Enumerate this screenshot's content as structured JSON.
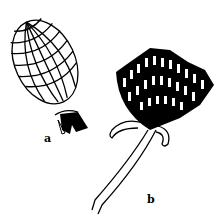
{
  "figure": {
    "type": "botanical-line-drawing",
    "panels": [
      {
        "id": "a",
        "label": "a",
        "subject": "closed flower bud covered with overlapping scales"
      },
      {
        "id": "b",
        "label": "b",
        "subject": "open flower head with stem and bracts"
      }
    ],
    "colors": {
      "ink": "#000000",
      "background": "#ffffff"
    }
  }
}
